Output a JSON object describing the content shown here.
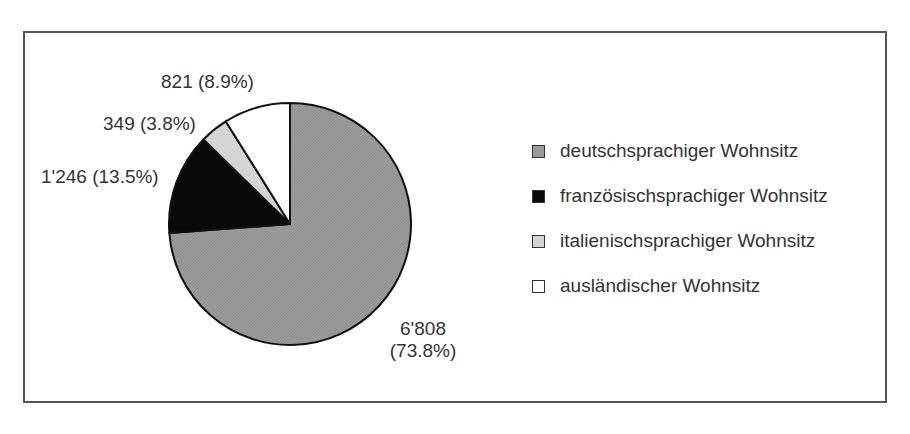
{
  "chart_data": {
    "type": "pie",
    "title": "",
    "slices": [
      {
        "name": "deutschsprachiger Wohnsitz",
        "value": 6808,
        "value_label": "6'808",
        "percent": 73.8,
        "percent_label": "(73.8%)",
        "color": "#9a9a9a"
      },
      {
        "name": "französischsprachiger Wohnsitz",
        "value": 1246,
        "value_label": "1'246",
        "percent": 13.5,
        "percent_label": "(13.5%)",
        "color": "#0a0a0a"
      },
      {
        "name": "italienischsprachiger Wohnsitz",
        "value": 349,
        "value_label": "349",
        "percent": 3.8,
        "percent_label": "(3.8%)",
        "color": "#d4d4d4"
      },
      {
        "name": "ausländischer Wohnsitz",
        "value": 821,
        "value_label": "821",
        "percent": 8.9,
        "percent_label": "(8.9%)",
        "color": "#ffffff"
      }
    ],
    "start_angle": "12 o'clock, clockwise",
    "legend_position": "right"
  },
  "labels": {
    "de": "6'808",
    "de_pct": "(73.8%)",
    "fr": "1'246 (13.5%)",
    "it": "349 (3.8%)",
    "aus": "821 (8.9%)"
  },
  "legend": [
    {
      "label": "deutschsprachiger Wohnsitz",
      "color": "#9a9a9a"
    },
    {
      "label": "französischsprachiger Wohnsitz",
      "color": "#0a0a0a"
    },
    {
      "label": "italienischsprachiger Wohnsitz",
      "color": "#d4d4d4"
    },
    {
      "label": "ausländischer Wohnsitz",
      "color": "#ffffff"
    }
  ]
}
